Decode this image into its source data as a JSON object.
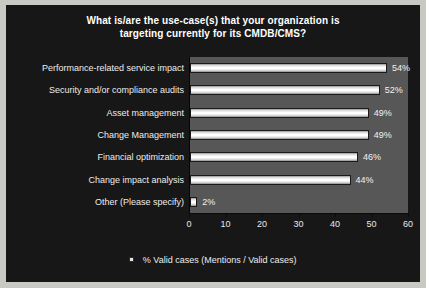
{
  "chart_data": {
    "type": "bar",
    "orientation": "horizontal",
    "title": "What is/are the use-case(s) that your organization is targeting currently for its CMDB/CMS?",
    "title_lines": [
      "What is/are the use-case(s) that your organization is",
      "targeting currently for its CMDB/CMS?"
    ],
    "categories": [
      "Performance-related service impact",
      "Security and/or compliance audits",
      "Asset management",
      "Change Management",
      "Financial optimization",
      "Change impact analysis",
      "Other (Please specify)"
    ],
    "values": [
      54,
      52,
      49,
      49,
      46,
      44,
      2
    ],
    "value_labels": [
      "54%",
      "52%",
      "49%",
      "49%",
      "46%",
      "44%",
      "2%"
    ],
    "xlabel": "",
    "ylabel": "",
    "xlim": [
      0,
      60
    ],
    "xticks": [
      0,
      10,
      20,
      30,
      40,
      50,
      60
    ],
    "xtick_labels": [
      "0",
      "10",
      "20",
      "30",
      "40",
      "50",
      "60"
    ],
    "grid": false,
    "legend_position": "bottom",
    "legend": [
      {
        "label": "% Valid cases (Mentions / Valid cases)",
        "marker": "square",
        "color": "#e6e6e6"
      }
    ],
    "colors": {
      "chart_background": "#171717",
      "plot_background": "#575757",
      "bar_fill": "#ffffff",
      "text": "#ededed",
      "frame_border": "#c9c9c4"
    }
  }
}
